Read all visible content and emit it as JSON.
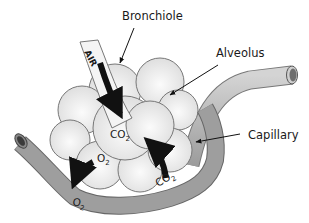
{
  "diagram": {
    "labels": {
      "bronchiole": "Bronchiole",
      "alveolus": "Alveolus",
      "capillary": "Capillary",
      "air": "AIR"
    },
    "gases": {
      "co2_center": {
        "main": "CO",
        "sub": "2"
      },
      "o2_alveolus": {
        "main": "O",
        "sub": "2"
      },
      "o2_capillary": {
        "main": "O",
        "sub": "2"
      },
      "co2_capillary": {
        "main": "CO",
        "sub": "2"
      }
    },
    "colors": {
      "alveolus_fill": "#e6e6e6",
      "alveolus_stroke": "#777777",
      "capillary_fill": "#9a9a9a",
      "capillary_light": "#c4c4c4",
      "bronchiole_fill": "#f2f2f2",
      "arrow": "#111111"
    }
  }
}
